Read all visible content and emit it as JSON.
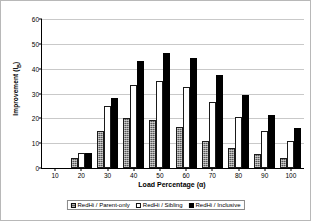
{
  "chart_data": {
    "type": "bar",
    "title": "",
    "xlabel": "Load Percentage (α)",
    "ylabel": "Improvement (I",
    "ylabel_sub": "B",
    "ylabel_suffix": ")",
    "categories": [
      "10",
      "20",
      "30",
      "40",
      "50",
      "60",
      "70",
      "80",
      "90",
      "100"
    ],
    "series": [
      {
        "name": "RedHi / Parent-only",
        "color": "#585858",
        "values": [
          0,
          4,
          15,
          20,
          19.5,
          16.5,
          11,
          8,
          5.5,
          4
        ]
      },
      {
        "name": "RedHi / Sibling",
        "color": "#ffffff",
        "values": [
          0,
          6,
          25,
          33.5,
          35,
          32.5,
          26.5,
          20.5,
          15,
          11
        ]
      },
      {
        "name": "RedHi / Inclusive",
        "color": "#000000",
        "values": [
          0,
          6,
          28,
          43,
          46.5,
          44.5,
          37.5,
          29.5,
          21.5,
          16
        ]
      }
    ],
    "ylim": [
      0,
      60
    ],
    "yticks": [
      0,
      10,
      20,
      30,
      40,
      50,
      60
    ],
    "xticks": [
      "10",
      "20",
      "30",
      "40",
      "50",
      "60",
      "70",
      "80",
      "90",
      "100"
    ],
    "grid": true,
    "legend_position": "bottom"
  }
}
